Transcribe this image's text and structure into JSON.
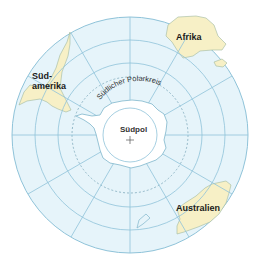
{
  "map": {
    "title": "Südpol-Projektion",
    "center_label": "Südpol",
    "polar_circle_label": "Südlicher Polarkreis",
    "continents": [
      {
        "name": "Afrika",
        "label": "Afrika"
      },
      {
        "name": "Südamerika",
        "label_line1": "Süd-",
        "label_line2": "amerika"
      },
      {
        "name": "Australien",
        "label": "Australien"
      },
      {
        "name": "Antarktis",
        "label": ""
      }
    ],
    "colors": {
      "ocean": "#e6f4fa",
      "land": "#f7f0c6",
      "grid": "#8fc3d9",
      "coast": "#7fb6cc",
      "antarctica": "#ffffff",
      "polar_circle": "#7fa9bb"
    }
  }
}
